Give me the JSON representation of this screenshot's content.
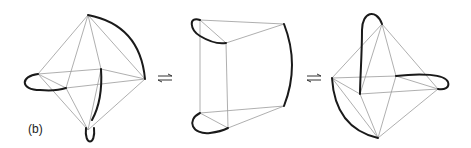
{
  "figure": {
    "label": "(b)",
    "panels": [
      {
        "name": "octahedron-left",
        "description": "octahedron with three bold loops (top-right arc, left loop, bottom loop)"
      },
      {
        "name": "prism-middle",
        "description": "triangular prism with bold loops on top-left, right edge and bottom-left"
      },
      {
        "name": "octahedron-right",
        "description": "octahedron with bold loops (top loop, right loop, bottom-left arc)"
      }
    ],
    "equilibrium_arrows": [
      "⇌",
      "⇌"
    ],
    "colors": {
      "thin_line": "#9a9a9a",
      "thick_line": "#1a1a1a",
      "background": "#ffffff"
    }
  }
}
